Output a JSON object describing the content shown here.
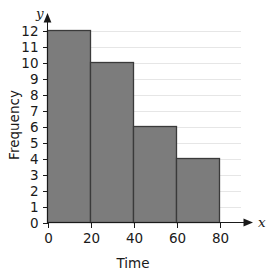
{
  "chart_data": {
    "type": "bar",
    "title": "",
    "subtitle": "",
    "xlabel": "Time",
    "ylabel": "Frequency",
    "x_axis_variable": "x",
    "y_axis_variable": "y",
    "categories": [
      "0-20",
      "20-40",
      "40-60",
      "60-80"
    ],
    "bin_edges": [
      0,
      20,
      40,
      60,
      80
    ],
    "values": [
      12,
      10,
      6,
      4
    ],
    "xlim": [
      0,
      80
    ],
    "ylim": [
      0,
      12
    ],
    "xticks": [
      0,
      20,
      40,
      60,
      80
    ],
    "xtick_labels": [
      "0",
      "20",
      "40",
      "60",
      "80"
    ],
    "yticks": [
      0,
      1,
      2,
      3,
      4,
      5,
      6,
      7,
      8,
      9,
      10,
      11,
      12
    ],
    "ytick_labels": [
      "0",
      "1",
      "2",
      "3",
      "4",
      "5",
      "6",
      "7",
      "8",
      "9",
      "10",
      "11",
      "12"
    ],
    "grid": "horizontal",
    "legend": "none",
    "annotations": [],
    "colors": {
      "bar_fill": "#7c7c7c",
      "bar_stroke": "#3a3a3a",
      "gridline": "#e6e6e6",
      "axis": "#1a1a1a",
      "background": "#ffffff",
      "text": "#1a1a1a"
    }
  }
}
